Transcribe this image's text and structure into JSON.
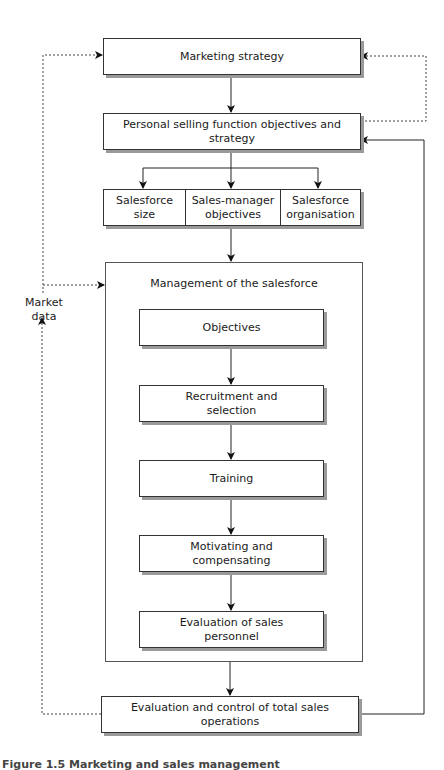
{
  "figure": {
    "nodes": {
      "marketing_strategy": "Marketing strategy",
      "personal_selling": "Personal selling function objectives and strategy",
      "salesforce_size": "Salesforce\nsize",
      "sales_manager_objectives": "Sales-manager\nobjectives",
      "salesforce_organisation": "Salesforce\norganisation",
      "management_container": "Management of the salesforce",
      "objectives": "Objectives",
      "recruitment": "Recruitment and\nselection",
      "training": "Training",
      "motivating": "Motivating and\ncompensating",
      "evaluation_personnel": "Evaluation of sales\npersonnel",
      "evaluation_control": "Evaluation and control of total sales operations"
    },
    "side_label": "Market\ndata",
    "edges": [
      {
        "from": "marketing_strategy",
        "to": "personal_selling",
        "style": "solid"
      },
      {
        "from": "personal_selling",
        "to": "salesforce_size",
        "style": "solid"
      },
      {
        "from": "personal_selling",
        "to": "sales_manager_objectives",
        "style": "solid"
      },
      {
        "from": "personal_selling",
        "to": "salesforce_organisation",
        "style": "solid"
      },
      {
        "from": "sales_manager_objectives",
        "to": "management_container",
        "style": "solid"
      },
      {
        "from": "objectives",
        "to": "recruitment",
        "style": "solid"
      },
      {
        "from": "recruitment",
        "to": "training",
        "style": "solid"
      },
      {
        "from": "training",
        "to": "motivating",
        "style": "solid"
      },
      {
        "from": "motivating",
        "to": "evaluation_personnel",
        "style": "solid"
      },
      {
        "from": "management_container",
        "to": "evaluation_control",
        "style": "solid"
      },
      {
        "from": "evaluation_control",
        "to": "personal_selling",
        "style": "solid"
      },
      {
        "from": "personal_selling",
        "to": "marketing_strategy",
        "style": "dotted"
      },
      {
        "from": "evaluation_control",
        "to": "marketing_strategy",
        "style": "dotted",
        "label": "Market data"
      },
      {
        "from": "evaluation_control",
        "to": "management_container",
        "style": "dotted"
      }
    ],
    "caption": "Figure 1.5  Marketing and sales management"
  }
}
